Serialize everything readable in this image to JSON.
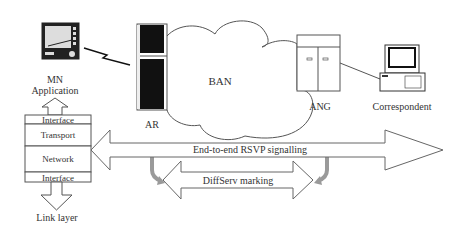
{
  "nodes": {
    "mn": {
      "label_line1": "MN",
      "label_line2": "Application",
      "icon": "pda-device-icon"
    },
    "ar": {
      "label": "AR",
      "icon": "server-tower-icon"
    },
    "ban": {
      "label": "BAN",
      "icon": "cloud-icon"
    },
    "ang": {
      "label": "ANG",
      "icon": "cabinet-icon"
    },
    "correspondent": {
      "label": "Correspondent",
      "icon": "desktop-computer-icon"
    }
  },
  "protocol_stack": {
    "layers": [
      "Interface",
      "Transport",
      "Network",
      "Interface"
    ],
    "below": "Link layer"
  },
  "arrows": {
    "rsvp": "End-to-end RSVP signalling",
    "diffserv": "DiffServ marking"
  },
  "colors": {
    "stroke": "#555555",
    "text": "#333333",
    "device_dark": "#111111",
    "curved_arrow": "#9a9a9a"
  }
}
